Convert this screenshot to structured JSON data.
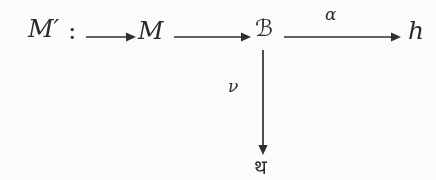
{
  "diagram": {
    "kind": "commutative-diagram",
    "background_color": "#fbfbfa",
    "ink_color": "#2f2f2f",
    "nodes": [
      {
        "id": "mprime",
        "label": "M′",
        "script": "math-italic",
        "x": 28,
        "y": 40
      },
      {
        "id": "colon",
        "label": ":",
        "script": "math-upright",
        "x": 68,
        "y": 40
      },
      {
        "id": "m",
        "label": "M",
        "script": "math-italic",
        "x": 138,
        "y": 40
      },
      {
        "id": "frak_k",
        "label": "ℬ",
        "script": "fraktur",
        "x": 255,
        "y": 40
      },
      {
        "id": "h",
        "label": "h",
        "script": "math-italic",
        "x": 408,
        "y": 40
      },
      {
        "id": "frak_h",
        "label": "थ",
        "script": "fraktur",
        "x": 254,
        "y": 170
      }
    ],
    "arrows": [
      {
        "id": "arrow-into-m",
        "from": "",
        "to": "m",
        "direction": "right",
        "label": "",
        "x1": 86,
        "y1": 37,
        "x2": 132,
        "y2": 37
      },
      {
        "id": "arrow-m-to-frak-k",
        "from": "m",
        "to": "frak_k",
        "direction": "right",
        "label": "",
        "x1": 174,
        "y1": 37,
        "x2": 250,
        "y2": 37
      },
      {
        "id": "arrow-frak-k-to-h",
        "from": "frak_k",
        "to": "h",
        "direction": "right",
        "label": "α",
        "x1": 284,
        "y1": 37,
        "x2": 400,
        "y2": 37
      },
      {
        "id": "arrow-frak-k-to-frak-h",
        "from": "frak_k",
        "to": "frak_h",
        "direction": "down",
        "label": "ν",
        "x1": 263,
        "y1": 50,
        "x2": 263,
        "y2": 154
      }
    ],
    "labels": {
      "alpha": "α",
      "nu": "ν"
    }
  }
}
